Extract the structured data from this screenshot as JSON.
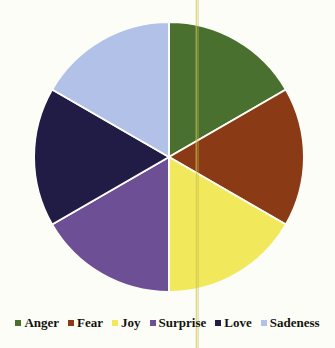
{
  "figure": {
    "background_color": "#fdfdf8"
  },
  "chart_data": {
    "type": "pie",
    "title": "",
    "subtitle": "",
    "xlabel": "",
    "ylabel": "",
    "categories": [
      "Anger",
      "Fear",
      "Joy",
      "Surprise",
      "Love",
      "Sadeness"
    ],
    "values": [
      1,
      1,
      1,
      1,
      1,
      1
    ],
    "percentages": [
      16.67,
      16.67,
      16.67,
      16.67,
      16.67,
      16.67
    ],
    "slice_angles_deg": [
      60,
      60,
      60,
      60,
      60,
      60
    ],
    "start_angle_deg": 0,
    "direction": "clockwise",
    "colors": [
      "#4a7030",
      "#8a3a14",
      "#f2e85c",
      "#6d4f96",
      "#201c46",
      "#b2c1e8"
    ],
    "slice_border_color": "#fdfdf8",
    "data_labels_shown": false,
    "grid": false,
    "legend_position": "bottom",
    "center": {
      "x": 169,
      "y": 157
    },
    "radius": 135
  },
  "legend": {
    "items": [
      {
        "label": "Anger",
        "color": "#4a7030"
      },
      {
        "label": "Fear",
        "color": "#8a3a14"
      },
      {
        "label": "Joy",
        "color": "#f2e85c"
      },
      {
        "label": "Surprise",
        "color": "#6d4f96"
      },
      {
        "label": "Love",
        "color": "#201c46"
      },
      {
        "label": "Sadeness",
        "color": "#b2c1e8"
      }
    ]
  },
  "artifacts": {
    "scan_streak_x": 196,
    "scan_streak_color": "#d7d060"
  }
}
